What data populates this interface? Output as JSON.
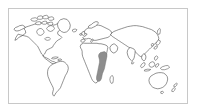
{
  "figure": {
    "kind": "world-map",
    "title": "",
    "width_px": 197,
    "height_px": 112,
    "background_color": "#ffffff",
    "frame": {
      "border_color": "#c8c8c8",
      "border_width_px": 1,
      "fill_color": "#ffffff"
    }
  },
  "map": {
    "projection": "robinson-like",
    "land_fill_color": "#ffffff",
    "coastline_color": "#3a3a3a",
    "coastline_width_px": 0.55,
    "ocean_color": "#ffffff",
    "graticule_visible": false,
    "labels_visible": false,
    "legend_visible": false
  },
  "highlight": {
    "label": "",
    "fill_color": "#8d8d8d",
    "stroke_color": "#6f6f6f",
    "region_name": "eastern-and-southern-africa",
    "approx_countries": [
      "Ethiopia",
      "Kenya",
      "Tanzania",
      "Malawi",
      "Zambia",
      "Zimbabwe",
      "Mozambique",
      "Botswana",
      "South Africa"
    ]
  },
  "landmasses": [
    {
      "name": "north-america"
    },
    {
      "name": "greenland"
    },
    {
      "name": "central-america"
    },
    {
      "name": "south-america"
    },
    {
      "name": "europe"
    },
    {
      "name": "africa"
    },
    {
      "name": "asia"
    },
    {
      "name": "southeast-asia-islands"
    },
    {
      "name": "australia"
    },
    {
      "name": "new-zealand"
    },
    {
      "name": "japan"
    },
    {
      "name": "british-isles"
    },
    {
      "name": "madagascar"
    },
    {
      "name": "arctic-islands"
    }
  ]
}
